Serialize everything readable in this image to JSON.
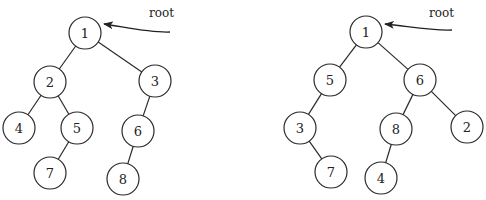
{
  "diagram": {
    "type": "binary-trees",
    "trees": [
      {
        "id": "left-tree",
        "root_label": "root",
        "nodes": [
          {
            "id": "L1",
            "label": "1"
          },
          {
            "id": "L2",
            "label": "2"
          },
          {
            "id": "L3",
            "label": "3"
          },
          {
            "id": "L4",
            "label": "4"
          },
          {
            "id": "L5",
            "label": "5"
          },
          {
            "id": "L6",
            "label": "6"
          },
          {
            "id": "L7",
            "label": "7"
          },
          {
            "id": "L8",
            "label": "8"
          }
        ],
        "edges": [
          {
            "from": "L1",
            "to": "L2"
          },
          {
            "from": "L1",
            "to": "L3"
          },
          {
            "from": "L2",
            "to": "L4"
          },
          {
            "from": "L2",
            "to": "L5"
          },
          {
            "from": "L5",
            "to": "L7"
          },
          {
            "from": "L3",
            "to": "L6"
          },
          {
            "from": "L6",
            "to": "L8"
          }
        ]
      },
      {
        "id": "right-tree",
        "root_label": "root",
        "nodes": [
          {
            "id": "R1",
            "label": "1"
          },
          {
            "id": "R5",
            "label": "5"
          },
          {
            "id": "R6",
            "label": "6"
          },
          {
            "id": "R3",
            "label": "3"
          },
          {
            "id": "R8",
            "label": "8"
          },
          {
            "id": "R2",
            "label": "2"
          },
          {
            "id": "R7",
            "label": "7"
          },
          {
            "id": "R4",
            "label": "4"
          }
        ],
        "edges": [
          {
            "from": "R1",
            "to": "R5"
          },
          {
            "from": "R1",
            "to": "R6"
          },
          {
            "from": "R5",
            "to": "R3"
          },
          {
            "from": "R3",
            "to": "R7"
          },
          {
            "from": "R6",
            "to": "R8"
          },
          {
            "from": "R6",
            "to": "R2"
          },
          {
            "from": "R8",
            "to": "R4"
          }
        ]
      }
    ]
  }
}
